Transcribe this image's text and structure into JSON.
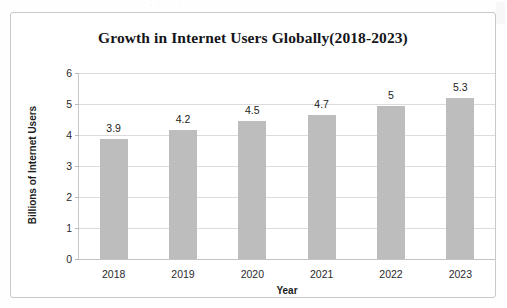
{
  "page": {
    "scan_remnant_text": "·  ·   ·  ·      ·"
  },
  "chart_data": {
    "type": "bar",
    "title": "Growth in Internet Users Globally(2018-2023)",
    "xlabel": "Year",
    "ylabel": "Billions of Internet Users",
    "categories": [
      "2018",
      "2019",
      "2020",
      "2021",
      "2022",
      "2023"
    ],
    "values": [
      3.9,
      4.2,
      4.5,
      4.7,
      5,
      5.3
    ],
    "value_labels": [
      "3.9",
      "4.2",
      "4.5",
      "4.7",
      "5",
      "5.3"
    ],
    "ylim": [
      0,
      6
    ],
    "ytick_labels": [
      "0",
      "1",
      "2",
      "3",
      "4",
      "5",
      "6"
    ],
    "ytick_values": [
      0,
      1,
      2,
      3,
      4,
      5,
      6
    ],
    "grid": true,
    "legend": false,
    "bar_color": "#bdbdbd",
    "gridline_color": "#dcdcde",
    "axis_color": "#c9c9cd",
    "text_color": "#1d1d21",
    "plot_bar_tops": [
      3.88,
      4.15,
      4.44,
      4.63,
      4.93,
      5.2
    ]
  }
}
